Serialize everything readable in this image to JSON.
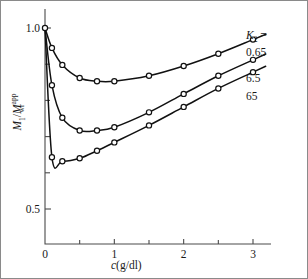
{
  "chart_data": {
    "type": "line",
    "title": "",
    "xlabel": "c(g/dl)",
    "ylabel": "M1/Mwr_app",
    "xlabel_parts": {
      "italic_c": "c",
      "rest": "(g/dl)"
    },
    "ylabel_parts": {
      "m1": "M",
      "m1_sub": "1",
      "slash": "/",
      "m2": "M",
      "m2_sub": "wr",
      "m2_sup": "app"
    },
    "xlim": [
      0,
      3.55
    ],
    "ylim": [
      0.44,
      1.05
    ],
    "grid": false,
    "legend_position": "right",
    "x_major_ticks": [
      0,
      1,
      2,
      3
    ],
    "x_major_ticklabels": [
      "0",
      "1",
      "2",
      "3"
    ],
    "x_minor_ticks": [
      0.5,
      1.5,
      2.5
    ],
    "y_major_ticks": [
      1.0,
      0.5
    ],
    "y_major_ticklabels": [
      "1.0",
      "0.5"
    ],
    "y_minor_ticks": [
      0.9,
      0.8,
      0.7,
      0.6
    ],
    "legend_header": "K2 =",
    "legend_header_parts": {
      "k": "K",
      "sub": "2",
      "eq": " ="
    },
    "series": [
      {
        "name": "0.65",
        "label": "0.65",
        "x": [
          0,
          0.1,
          0.25,
          0.5,
          0.75,
          1.0,
          1.5,
          2.0,
          2.5,
          3.0
        ],
        "y": [
          1.0,
          0.945,
          0.898,
          0.862,
          0.853,
          0.853,
          0.868,
          0.895,
          0.929,
          0.968
        ]
      },
      {
        "name": "6.5",
        "label": "6.5",
        "x": [
          0,
          0.1,
          0.25,
          0.5,
          0.75,
          1.0,
          1.5,
          2.0,
          2.5,
          3.0
        ],
        "y": [
          1.0,
          0.842,
          0.752,
          0.717,
          0.717,
          0.726,
          0.767,
          0.818,
          0.868,
          0.912
        ]
      },
      {
        "name": "65",
        "label": "65",
        "x": [
          0,
          0.1,
          0.25,
          0.5,
          0.75,
          1.0,
          1.5,
          2.0,
          2.5,
          3.0
        ],
        "y": [
          1.0,
          0.643,
          0.632,
          0.64,
          0.661,
          0.684,
          0.731,
          0.782,
          0.833,
          0.878
        ]
      }
    ],
    "marker": "open-circle",
    "line_color": "#111111"
  }
}
